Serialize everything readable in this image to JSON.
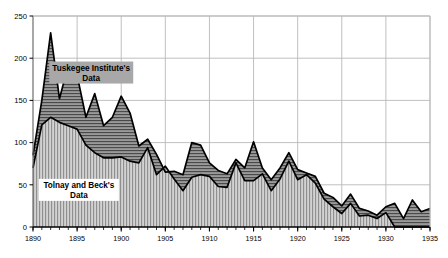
{
  "chart_data": {
    "type": "area",
    "title": "",
    "subtitle": "",
    "xlabel": "",
    "ylabel": "",
    "xlim": [
      1890,
      1935
    ],
    "ylim": [
      0,
      250
    ],
    "grid": true,
    "legend_position": "inline-annotations",
    "xticks": [
      "1890",
      "1895",
      "1900",
      "1905",
      "1910",
      "1915",
      "1920",
      "1925",
      "1930",
      "1935"
    ],
    "yticks": [
      "0",
      "50",
      "100",
      "150",
      "200",
      "250"
    ],
    "x": [
      1890,
      1891,
      1892,
      1893,
      1894,
      1895,
      1896,
      1897,
      1898,
      1899,
      1900,
      1901,
      1902,
      1903,
      1904,
      1905,
      1906,
      1907,
      1908,
      1909,
      1910,
      1911,
      1912,
      1913,
      1914,
      1915,
      1916,
      1917,
      1918,
      1919,
      1920,
      1921,
      1922,
      1923,
      1924,
      1925,
      1926,
      1927,
      1928,
      1929,
      1930,
      1931,
      1932,
      1933,
      1934,
      1935
    ],
    "series": [
      {
        "name": "Tuskegee Institute's Data",
        "fill_pattern": "horizontal-hatch",
        "values": [
          85,
          150,
          230,
          152,
          192,
          180,
          130,
          158,
          120,
          130,
          155,
          135,
          96,
          104,
          86,
          65,
          66,
          62,
          100,
          97,
          76,
          67,
          63,
          80,
          70,
          101,
          70,
          56,
          70,
          88,
          68,
          64,
          60,
          40,
          35,
          25,
          39,
          22,
          19,
          14,
          24,
          28,
          10,
          32,
          18,
          22
        ]
      },
      {
        "name": "Tolnay and Beck's Data",
        "fill_pattern": "vertical-hatch",
        "values": [
          70,
          121,
          130,
          124,
          120,
          116,
          97,
          88,
          82,
          82,
          83,
          78,
          76,
          94,
          62,
          72,
          57,
          43,
          59,
          62,
          60,
          48,
          47,
          76,
          55,
          55,
          63,
          43,
          57,
          78,
          56,
          62,
          52,
          33,
          24,
          16,
          28,
          13,
          14,
          10,
          17,
          0,
          0,
          0,
          0,
          0
        ]
      }
    ],
    "annotations": [
      {
        "text_line1": "Tuskegee Institute's",
        "text_line2": "Data",
        "background": "#a8a8a8",
        "x_data": 1896.6,
        "y_data": 183
      },
      {
        "text_line1": "Tolnay and Beck's",
        "text_line2": "Data",
        "background": "#ffffff",
        "x_data": 1895.2,
        "y_data": 44
      }
    ],
    "colors": {
      "line": "#000000",
      "upper_fill": "#8c8c8c",
      "lower_fill": "#b5b5b5",
      "grid": "#b9b9b9",
      "axis": "#6d6d6d",
      "background": "#ffffff"
    }
  }
}
